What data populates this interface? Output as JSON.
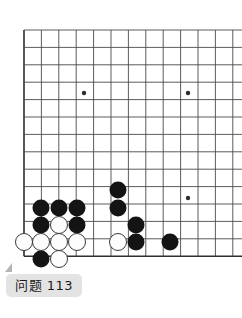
{
  "board": {
    "name": "go-board",
    "background_color": "#ffffff",
    "line_color": "#4a4a4a",
    "edge_color": "#2e2e2e",
    "origin_x": 24,
    "origin_y": 30,
    "spacing": 17.4,
    "cols_visible": 13,
    "rows_visible": 14,
    "stone_radius": 8.5,
    "star_point_radius": 2.2,
    "star_points": [
      {
        "x": 84,
        "y": 93
      },
      {
        "x": 188,
        "y": 93
      },
      {
        "x": 188,
        "y": 198
      }
    ],
    "stones": [
      {
        "color": "black",
        "x": 118,
        "y": 190
      },
      {
        "color": "black",
        "x": 118,
        "y": 208
      },
      {
        "color": "black",
        "x": 136,
        "y": 225
      },
      {
        "color": "black",
        "x": 136,
        "y": 242
      },
      {
        "color": "black",
        "x": 170,
        "y": 242
      },
      {
        "color": "black",
        "x": 41,
        "y": 208
      },
      {
        "color": "black",
        "x": 59,
        "y": 208
      },
      {
        "color": "black",
        "x": 77,
        "y": 208
      },
      {
        "color": "black",
        "x": 41,
        "y": 225
      },
      {
        "color": "black",
        "x": 77,
        "y": 225
      },
      {
        "color": "black",
        "x": 41,
        "y": 259
      },
      {
        "color": "white",
        "x": 59,
        "y": 225
      },
      {
        "color": "white",
        "x": 24,
        "y": 242
      },
      {
        "color": "white",
        "x": 41,
        "y": 242
      },
      {
        "color": "white",
        "x": 59,
        "y": 242
      },
      {
        "color": "white",
        "x": 77,
        "y": 242
      },
      {
        "color": "white",
        "x": 118,
        "y": 242
      },
      {
        "color": "white",
        "x": 59,
        "y": 259
      }
    ],
    "stone_colors": {
      "black_fill": "#141414",
      "white_fill": "#fdfdfd",
      "white_stroke": "#3a3a3a"
    }
  },
  "caption": {
    "label": "问题 113",
    "chip_color": "#e3e3e3",
    "pointer_color": "#b6b6b6",
    "text_color": "#1b1b1b"
  }
}
